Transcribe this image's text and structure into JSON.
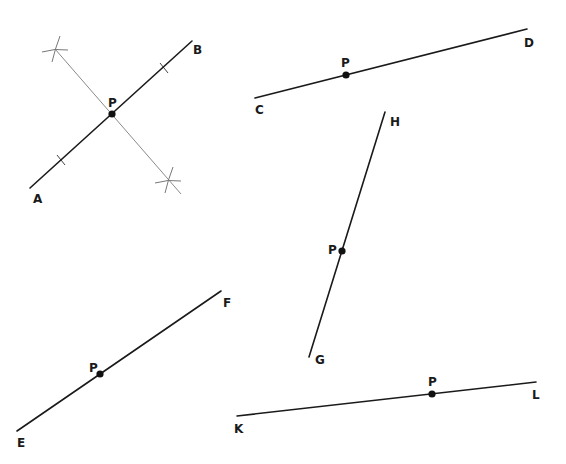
{
  "diagram": {
    "colors": {
      "line": "#1a1a1a",
      "construction": "#8a8a8a",
      "point": "#111111"
    },
    "figures": [
      {
        "id": "AB",
        "segment": {
          "from": {
            "label": "A",
            "x": 30,
            "y": 188
          },
          "to": {
            "label": "B",
            "x": 192,
            "y": 41
          }
        },
        "point": {
          "label": "P",
          "x": 112,
          "y": 114
        },
        "has_construction": true,
        "construction": {
          "bisector": {
            "from": {
              "x": 55,
              "y": 49
            },
            "to": {
              "x": 181,
              "y": 194
            }
          },
          "arc_marks": [
            {
              "x": 55,
              "y": 49
            },
            {
              "x": 168,
              "y": 180
            }
          ],
          "ticks": [
            {
              "x": 61,
              "y": 160
            },
            {
              "x": 164,
              "y": 68
            }
          ]
        },
        "labels": [
          {
            "text": "A",
            "x": 33,
            "y": 203
          },
          {
            "text": "B",
            "x": 193,
            "y": 54
          },
          {
            "text": "P",
            "x": 108,
            "y": 107
          }
        ]
      },
      {
        "id": "CD",
        "segment": {
          "from": {
            "label": "C",
            "x": 255,
            "y": 98
          },
          "to": {
            "label": "D",
            "x": 527,
            "y": 29
          }
        },
        "point": {
          "label": "P",
          "x": 346,
          "y": 75
        },
        "labels": [
          {
            "text": "C",
            "x": 255,
            "y": 114
          },
          {
            "text": "D",
            "x": 524,
            "y": 47
          },
          {
            "text": "P",
            "x": 341,
            "y": 67
          }
        ]
      },
      {
        "id": "GH",
        "segment": {
          "from": {
            "label": "G",
            "x": 309,
            "y": 357
          },
          "to": {
            "label": "H",
            "x": 385,
            "y": 112
          }
        },
        "point": {
          "label": "P",
          "x": 342,
          "y": 251
        },
        "labels": [
          {
            "text": "G",
            "x": 315,
            "y": 364
          },
          {
            "text": "H",
            "x": 390,
            "y": 126
          },
          {
            "text": "P",
            "x": 328,
            "y": 254
          }
        ]
      },
      {
        "id": "EF",
        "segment": {
          "from": {
            "label": "E",
            "x": 17,
            "y": 431
          },
          "to": {
            "label": "F",
            "x": 221,
            "y": 291
          }
        },
        "point": {
          "label": "P",
          "x": 100,
          "y": 374
        },
        "labels": [
          {
            "text": "E",
            "x": 17,
            "y": 447
          },
          {
            "text": "F",
            "x": 223,
            "y": 307
          },
          {
            "text": "P",
            "x": 89,
            "y": 372
          }
        ]
      },
      {
        "id": "KL",
        "segment": {
          "from": {
            "label": "K",
            "x": 237,
            "y": 416
          },
          "to": {
            "label": "L",
            "x": 536,
            "y": 382
          }
        },
        "point": {
          "label": "P",
          "x": 432,
          "y": 394
        },
        "labels": [
          {
            "text": "K",
            "x": 234,
            "y": 433
          },
          {
            "text": "L",
            "x": 532,
            "y": 399
          },
          {
            "text": "P",
            "x": 428,
            "y": 386
          }
        ]
      }
    ]
  }
}
